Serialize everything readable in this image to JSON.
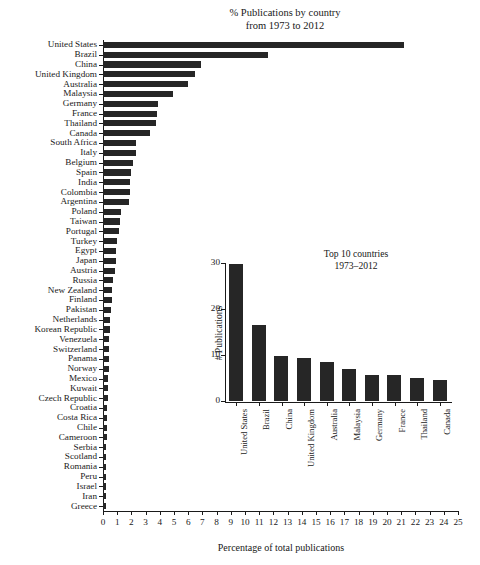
{
  "chart_data": [
    {
      "id": "main",
      "type": "bar",
      "orientation": "horizontal",
      "title": "% Publications by country",
      "subtitle": "from 1973 to 2012",
      "xlabel": "Percentage of total publications",
      "ylabel": "",
      "xlim": [
        0,
        25
      ],
      "xticks": [
        0,
        1,
        2,
        3,
        4,
        5,
        6,
        7,
        8,
        9,
        10,
        11,
        12,
        13,
        14,
        15,
        16,
        17,
        18,
        19,
        20,
        21,
        22,
        23,
        24,
        25
      ],
      "grid": false,
      "legend": "none",
      "bar_color": "#262626",
      "categories": [
        "United States",
        "Brazil",
        "China",
        "United Kingdom",
        "Australia",
        "Malaysia",
        "Germany",
        "France",
        "Thailand",
        "Canada",
        "South Africa",
        "Italy",
        "Belgium",
        "Spain",
        "India",
        "Colombia",
        "Argentina",
        "Poland",
        "Taiwan",
        "Portugal",
        "Turkey",
        "Egypt",
        "Japan",
        "Austria",
        "Russia",
        "New Zealand",
        "Finland",
        "Pakistan",
        "Netherlands",
        "Korean Republic",
        "Venezuela",
        "Switzerland",
        "Panama",
        "Norway",
        "Mexico",
        "Kuwait",
        "Czech Republic",
        "Croatia",
        "Costa Rica",
        "Chile",
        "Cameroon",
        "Serbia",
        "Scotland",
        "Romania",
        "Peru",
        "Israel",
        "Iran",
        "Greece"
      ],
      "values": [
        21.2,
        11.6,
        6.9,
        6.5,
        6.0,
        4.9,
        3.9,
        3.8,
        3.7,
        3.3,
        2.3,
        2.3,
        2.1,
        2.0,
        1.9,
        1.9,
        1.8,
        1.3,
        1.2,
        1.1,
        1.0,
        0.95,
        0.9,
        0.85,
        0.7,
        0.65,
        0.6,
        0.55,
        0.5,
        0.5,
        0.45,
        0.45,
        0.4,
        0.4,
        0.38,
        0.35,
        0.33,
        0.3,
        0.3,
        0.3,
        0.28,
        0.2,
        0.2,
        0.2,
        0.2,
        0.2,
        0.2,
        0.2
      ]
    },
    {
      "id": "inset",
      "type": "bar",
      "orientation": "vertical",
      "title": "Top 10 countries",
      "subtitle": "1973–2012",
      "xlabel": "",
      "ylabel": "# Publications",
      "ylim": [
        0,
        30
      ],
      "yticks": [
        0,
        10,
        20,
        30
      ],
      "grid": false,
      "legend": "none",
      "bar_color": "#262626",
      "categories": [
        "United States",
        "Brazil",
        "China",
        "United Kingdom",
        "Australia",
        "Malaysia",
        "Germany",
        "France",
        "Thailand",
        "Canada"
      ],
      "values": [
        29.8,
        16.5,
        9.7,
        9.3,
        8.5,
        7.0,
        5.7,
        5.7,
        5.1,
        4.5
      ]
    }
  ]
}
